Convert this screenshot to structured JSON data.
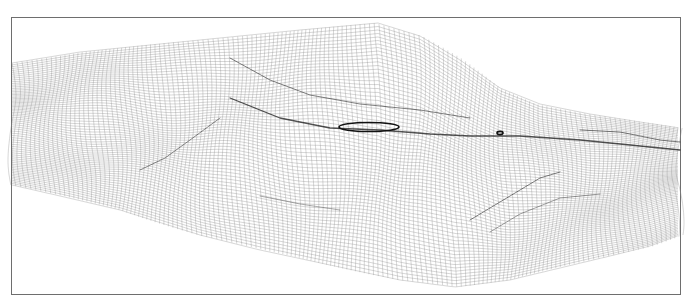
{
  "figure": {
    "type": "3d-wireframe-surface",
    "background": "#ffffff",
    "frame": {
      "x": 11,
      "y": 17,
      "width": 670,
      "height": 278,
      "color": "#6e6e6e"
    },
    "mesh_color": "#8a8a8a",
    "crease_color": "#1a1a1a",
    "outline": {
      "top_edge": [
        [
          12,
          63
        ],
        [
          80,
          52
        ],
        [
          160,
          44
        ],
        [
          240,
          36
        ],
        [
          300,
          30
        ],
        [
          378,
          23
        ],
        [
          420,
          36
        ],
        [
          460,
          60
        ],
        [
          500,
          88
        ],
        [
          540,
          104
        ],
        [
          590,
          114
        ],
        [
          640,
          122
        ],
        [
          680,
          128
        ]
      ],
      "bottom_edge": [
        [
          12,
          185
        ],
        [
          60,
          196
        ],
        [
          120,
          210
        ],
        [
          200,
          235
        ],
        [
          260,
          250
        ],
        [
          330,
          265
        ],
        [
          400,
          280
        ],
        [
          455,
          287
        ],
        [
          510,
          280
        ],
        [
          560,
          268
        ],
        [
          610,
          256
        ],
        [
          650,
          246
        ],
        [
          680,
          235
        ]
      ]
    },
    "rows": 70,
    "cols": 150,
    "creases": [
      {
        "name": "upper-ridge",
        "points": [
          [
            230,
            58
          ],
          [
            270,
            80
          ],
          [
            310,
            95
          ],
          [
            360,
            104
          ],
          [
            420,
            110
          ],
          [
            470,
            118
          ]
        ],
        "weight": 1.0,
        "opacity": 0.55
      },
      {
        "name": "central-trough",
        "points": [
          [
            230,
            98
          ],
          [
            280,
            118
          ],
          [
            330,
            128
          ],
          [
            380,
            130
          ],
          [
            430,
            134
          ],
          [
            470,
            136
          ],
          [
            520,
            136
          ],
          [
            580,
            140
          ],
          [
            640,
            146
          ],
          [
            680,
            150
          ]
        ],
        "weight": 1.3,
        "opacity": 0.75
      },
      {
        "name": "left-trough",
        "points": [
          [
            140,
            170
          ],
          [
            165,
            158
          ],
          [
            190,
            140
          ],
          [
            220,
            118
          ]
        ],
        "weight": 1.0,
        "opacity": 0.5
      },
      {
        "name": "lower-right-crease",
        "points": [
          [
            470,
            220
          ],
          [
            510,
            196
          ],
          [
            540,
            178
          ],
          [
            560,
            172
          ]
        ],
        "weight": 1.0,
        "opacity": 0.55
      },
      {
        "name": "lower-right-crease-2",
        "points": [
          [
            490,
            232
          ],
          [
            520,
            214
          ],
          [
            560,
            198
          ],
          [
            600,
            194
          ]
        ],
        "weight": 0.9,
        "opacity": 0.45
      },
      {
        "name": "right-ridge",
        "points": [
          [
            580,
            130
          ],
          [
            620,
            132
          ],
          [
            660,
            140
          ],
          [
            680,
            142
          ]
        ],
        "weight": 1.0,
        "opacity": 0.55
      },
      {
        "name": "bottom-crease",
        "points": [
          [
            260,
            196
          ],
          [
            300,
            204
          ],
          [
            340,
            210
          ]
        ],
        "weight": 0.8,
        "opacity": 0.45
      }
    ],
    "highlight_loop": {
      "name": "closed-contour-loop",
      "cx": 369,
      "cy": 127,
      "rx": 30,
      "ry": 4.5,
      "color": "#111111"
    },
    "small_loop": {
      "name": "small-contour-loop",
      "cx": 500,
      "cy": 133,
      "rx": 3,
      "ry": 1.6,
      "color": "#111111"
    }
  }
}
